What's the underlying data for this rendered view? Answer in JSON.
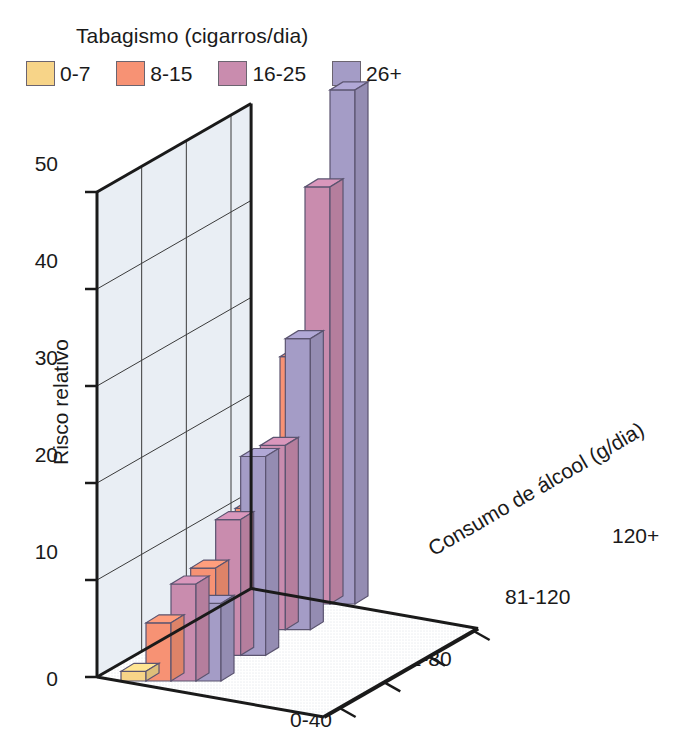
{
  "legend": {
    "title": "Tabagismo (cigarros/dia)",
    "entries": [
      {
        "label": "0-7",
        "color": "#F7D488"
      },
      {
        "label": "8-15",
        "color": "#F79274"
      },
      {
        "label": "16-25",
        "color": "#C98CAE"
      },
      {
        "label": "26+",
        "color": "#A49CC6"
      }
    ]
  },
  "axes": {
    "y_title": "Risco relativo",
    "x_title": "Consumo de álcool (g/dia)",
    "y_ticks": [
      "0",
      "10",
      "20",
      "30",
      "40",
      "50"
    ]
  },
  "categories": [
    "0-40",
    "41-80",
    "81-120",
    "120+"
  ],
  "chart_data": {
    "type": "bar",
    "title": "",
    "subtitle": "",
    "xlabel": "Consumo de álcool (g/dia)",
    "ylabel": "Risco relativo",
    "ylim": [
      0,
      50
    ],
    "yticks": [
      0,
      10,
      20,
      30,
      40,
      50
    ],
    "grid": true,
    "legend_position": "top-left",
    "legend_title": "Tabagismo (cigarros/dia)",
    "projection": "3d-bar",
    "categories": [
      "0-40",
      "41-80",
      "81-120",
      "120+"
    ],
    "series": [
      {
        "name": "0-7",
        "color": "#F7D488",
        "values": [
          1,
          3,
          5,
          9
        ]
      },
      {
        "name": "8-15",
        "color": "#F79274",
        "values": [
          6,
          9,
          12.5,
          25.5
        ]
      },
      {
        "name": "16-25",
        "color": "#C98CAE",
        "values": [
          10,
          14,
          19,
          43
        ]
      },
      {
        "name": "26+",
        "color": "#A49CC6",
        "values": [
          8,
          20.5,
          30,
          53
        ]
      }
    ]
  }
}
